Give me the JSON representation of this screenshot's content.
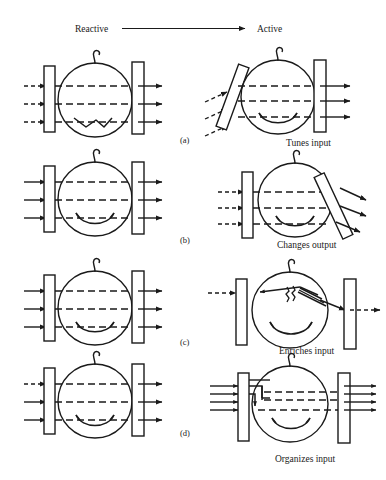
{
  "figure": {
    "title_axis": {
      "left_label": "Reactive",
      "right_label": "Active",
      "arrow_icon": "right-arrow-icon"
    },
    "rows": [
      {
        "id": "a",
        "row_label": "(a)",
        "left": {
          "name": "reactive-baby-tunes",
          "face_mouth": "frown",
          "input_arrows": 3,
          "output_arrows": 3,
          "left_barrier_angle_deg": 0,
          "right_barrier_angle_deg": 0,
          "input_style": "dashed",
          "output_style": "solid"
        },
        "right": {
          "name": "active-baby-tunes",
          "caption": "Tunes input",
          "face_mouth": "smile",
          "input_arrows": 3,
          "output_arrows": 3,
          "left_barrier_angle_deg": 20,
          "right_barrier_angle_deg": 0,
          "input_style": "dashed",
          "output_style": "solid"
        }
      },
      {
        "id": "b",
        "row_label": "(b)",
        "left": {
          "name": "reactive-baby-changes",
          "face_mouth": "smile",
          "input_arrows": 3,
          "output_arrows": 3,
          "left_barrier_angle_deg": 0,
          "right_barrier_angle_deg": 0,
          "input_style": "solid",
          "output_style": "solid"
        },
        "right": {
          "name": "active-baby-changes",
          "caption": "Changes output",
          "face_mouth": "smile",
          "input_arrows": 3,
          "output_arrows": 3,
          "left_barrier_angle_deg": 0,
          "right_barrier_angle_deg": -25,
          "input_style": "dashed",
          "output_style": "solid"
        }
      },
      {
        "id": "c",
        "row_label": "(c)",
        "left": {
          "name": "reactive-baby-enriches",
          "face_mouth": "smile",
          "input_arrows": 3,
          "output_arrows": 3,
          "left_barrier_angle_deg": 0,
          "right_barrier_angle_deg": 0,
          "input_style": "solid",
          "output_style": "solid"
        },
        "right": {
          "name": "active-baby-enriches",
          "caption": "Enriches input",
          "face_mouth": "smile",
          "input_arrows": 1,
          "output_arrows": 1,
          "internal_fan_arrows": 5,
          "left_barrier_angle_deg": 0,
          "right_barrier_angle_deg": 0,
          "input_style": "dashed",
          "output_style": "dashed"
        }
      },
      {
        "id": "d",
        "row_label": "(d)",
        "left": {
          "name": "reactive-baby-organizes",
          "face_mouth": "smile",
          "input_arrows": 3,
          "output_arrows": 3,
          "left_barrier_angle_deg": 0,
          "right_barrier_angle_deg": 0,
          "input_style": "dashed",
          "output_style": "solid"
        },
        "right": {
          "name": "active-baby-organizes",
          "caption": "Organizes input",
          "face_mouth": "smile",
          "input_arrows": 4,
          "output_arrows": 4,
          "internal_routing": "converging-bundle",
          "left_barrier_angle_deg": 0,
          "right_barrier_angle_deg": 0,
          "input_style": "solid",
          "output_style": "solid"
        }
      }
    ],
    "colors": {
      "ink": "#1a1a1a",
      "background": "#ffffff"
    }
  }
}
